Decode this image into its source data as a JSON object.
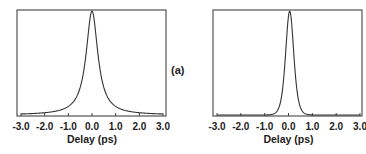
{
  "panel_label": "(a)",
  "chart_data": [
    {
      "type": "line",
      "title": "",
      "xlabel": "Delay (ps)",
      "ylabel": "",
      "xlim": [
        -3.0,
        3.0
      ],
      "ylim": [
        0,
        1
      ],
      "grid": false,
      "x_ticks": [
        "-3.0",
        "-2.0",
        "-1.0",
        "0.0",
        "1.0",
        "2.0",
        "3.0"
      ],
      "series": [
        {
          "name": "left trace",
          "shape": "lorentzian-like peak",
          "center": 0.0,
          "fwhm_ps": 0.6,
          "x": [
            -3.0,
            -2.5,
            -2.0,
            -1.5,
            -1.0,
            -0.75,
            -0.5,
            -0.3,
            -0.15,
            0.0,
            0.15,
            0.3,
            0.5,
            0.75,
            1.0,
            1.5,
            2.0,
            2.5,
            3.0
          ],
          "y": [
            0.01,
            0.02,
            0.04,
            0.08,
            0.16,
            0.25,
            0.4,
            0.62,
            0.85,
            1.0,
            0.85,
            0.62,
            0.4,
            0.25,
            0.16,
            0.08,
            0.04,
            0.02,
            0.01
          ]
        }
      ]
    },
    {
      "type": "line",
      "title": "",
      "xlabel": "Delay (ps)",
      "ylabel": "",
      "xlim": [
        -3.0,
        3.0
      ],
      "ylim": [
        0,
        1
      ],
      "grid": false,
      "x_ticks": [
        "-3.0",
        "-2.0",
        "-1.0",
        "0.0",
        "1.0",
        "2.0",
        "3.0"
      ],
      "series": [
        {
          "name": "right trace",
          "shape": "sech2-like peak",
          "center": 0.05,
          "fwhm_ps": 0.4,
          "x": [
            -3.0,
            -2.0,
            -1.5,
            -1.0,
            -0.75,
            -0.5,
            -0.3,
            -0.15,
            0.05,
            0.25,
            0.4,
            0.6,
            0.85,
            1.1,
            1.5,
            2.0,
            3.0
          ],
          "y": [
            0.0,
            0.0,
            0.01,
            0.03,
            0.08,
            0.2,
            0.45,
            0.75,
            1.0,
            0.75,
            0.45,
            0.2,
            0.08,
            0.03,
            0.01,
            0.0,
            0.0
          ]
        }
      ]
    }
  ]
}
